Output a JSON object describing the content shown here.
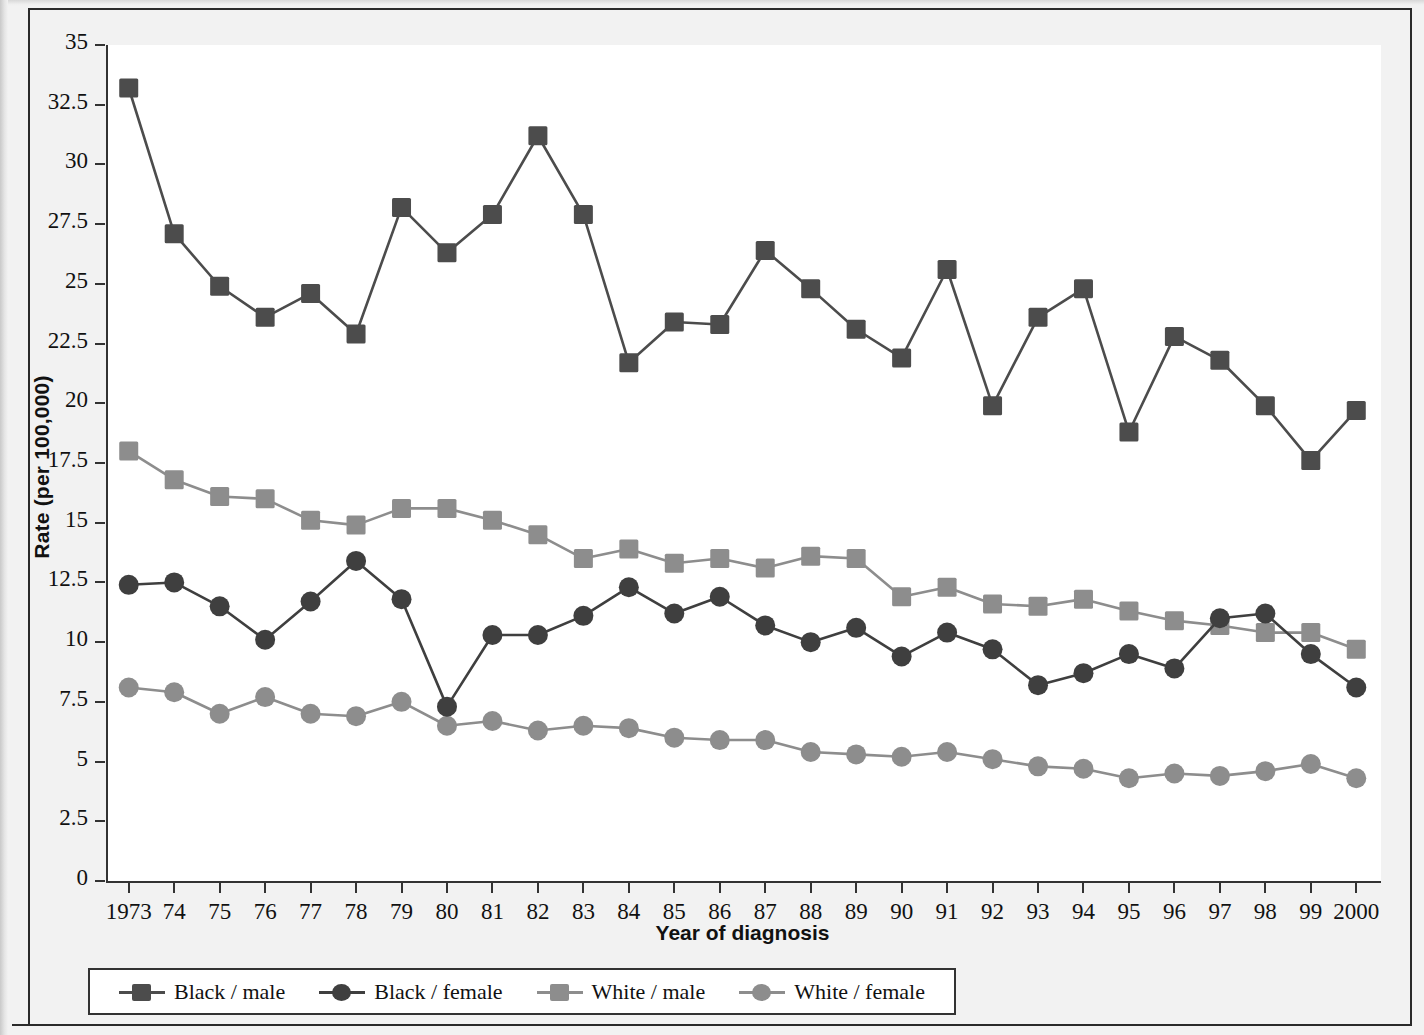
{
  "chart_data": {
    "type": "line",
    "title": "",
    "xlabel": "Year of diagnosis",
    "ylabel": "Rate (per 100,000)",
    "ylim": [
      0,
      35
    ],
    "ytick_labels": [
      "35",
      "32.5",
      "30",
      "27.5",
      "25",
      "22.5",
      "20",
      "17.5",
      "15",
      "12.5",
      "10",
      "7.5",
      "5",
      "2.5",
      "0"
    ],
    "ytick_values": [
      35,
      32.5,
      30,
      27.5,
      25,
      22.5,
      20,
      17.5,
      15,
      12.5,
      10,
      7.5,
      5,
      2.5,
      0
    ],
    "grid": false,
    "legend_position": "bottom",
    "x": [
      1973,
      1974,
      1975,
      1976,
      1977,
      1978,
      1979,
      1980,
      1981,
      1982,
      1983,
      1984,
      1985,
      1986,
      1987,
      1988,
      1989,
      1990,
      1991,
      1992,
      1993,
      1994,
      1995,
      1996,
      1997,
      1998,
      1999,
      2000
    ],
    "categories": [
      "1973",
      "74",
      "75",
      "76",
      "77",
      "78",
      "79",
      "80",
      "81",
      "82",
      "83",
      "84",
      "85",
      "86",
      "87",
      "88",
      "89",
      "90",
      "91",
      "92",
      "93",
      "94",
      "95",
      "96",
      "97",
      "98",
      "99",
      "2000"
    ],
    "series": [
      {
        "name": "Black / male",
        "color": "#4c4c4c",
        "marker": "square",
        "values": [
          33.2,
          27.1,
          24.9,
          23.6,
          24.6,
          22.9,
          28.2,
          26.3,
          27.9,
          31.2,
          27.9,
          21.7,
          23.4,
          23.3,
          26.4,
          24.8,
          23.1,
          21.9,
          25.6,
          19.9,
          23.6,
          24.8,
          18.8,
          22.8,
          21.8,
          19.9,
          17.6,
          19.7
        ]
      },
      {
        "name": "Black / female",
        "color": "#3f3f3f",
        "marker": "circle",
        "values": [
          12.4,
          12.5,
          11.5,
          10.1,
          11.7,
          13.4,
          11.8,
          7.3,
          10.3,
          10.3,
          11.1,
          12.3,
          11.2,
          11.9,
          10.7,
          10.0,
          10.6,
          9.4,
          10.4,
          9.7,
          8.2,
          8.7,
          9.5,
          8.9,
          11.0,
          11.2,
          9.5,
          8.1
        ]
      },
      {
        "name": "White / male",
        "color": "#8d8d8d",
        "marker": "square",
        "values": [
          18.0,
          16.8,
          16.1,
          16.0,
          15.1,
          14.9,
          15.6,
          15.6,
          15.1,
          14.5,
          13.5,
          13.9,
          13.3,
          13.5,
          13.1,
          13.6,
          13.5,
          11.9,
          12.3,
          11.6,
          11.5,
          11.8,
          11.3,
          10.9,
          10.7,
          10.4,
          10.4,
          9.7
        ]
      },
      {
        "name": "White / female",
        "color": "#8d8d8d",
        "marker": "circle",
        "values": [
          8.1,
          7.9,
          7.0,
          7.7,
          7.0,
          6.9,
          7.5,
          6.5,
          6.7,
          6.3,
          6.5,
          6.4,
          6.0,
          5.9,
          5.9,
          5.4,
          5.3,
          5.2,
          5.4,
          5.1,
          4.8,
          4.7,
          4.3,
          4.5,
          4.4,
          4.6,
          4.9,
          4.3
        ]
      }
    ]
  }
}
